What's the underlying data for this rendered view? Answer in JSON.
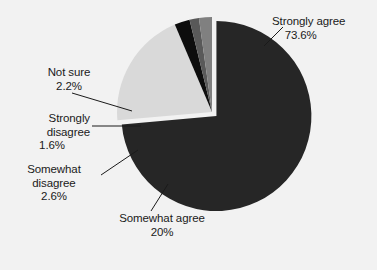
{
  "background_color": "#f2f2f2",
  "chart_data": {
    "type": "pie",
    "title": "",
    "subtitle": "",
    "xlabel": "",
    "ylabel": "",
    "legend_position": "none",
    "grid": false,
    "labels_outside": true,
    "exploded_slice": "Strongly agree",
    "categories": [
      "Strongly agree",
      "Somewhat agree",
      "Somewhat disagree",
      "Strongly disagree",
      "Not sure"
    ],
    "values": [
      73.6,
      20,
      2.6,
      1.6,
      2.2
    ],
    "value_labels": [
      "73.6%",
      "20%",
      "2.6%",
      "1.6%",
      "2.2%"
    ],
    "colors": [
      "#262626",
      "#d9d9d9",
      "#0d0d0d",
      "#595959",
      "#808080"
    ],
    "slices": [
      {
        "name": "Strongly agree",
        "value": 73.6,
        "value_label": "73.6%",
        "color": "#262626",
        "exploded": true
      },
      {
        "name": "Somewhat agree",
        "value": 20,
        "value_label": "20%",
        "color": "#d9d9d9",
        "exploded": false
      },
      {
        "name": "Somewhat disagree",
        "value": 2.6,
        "value_label": "2.6%",
        "color": "#0d0d0d",
        "exploded": false
      },
      {
        "name": "Strongly disagree",
        "value": 1.6,
        "value_label": "1.6%",
        "color": "#595959",
        "exploded": false
      },
      {
        "name": "Not sure",
        "value": 2.2,
        "value_label": "2.2%",
        "color": "#808080",
        "exploded": false
      }
    ]
  },
  "labels": {
    "strongly_agree": {
      "line1": "Strongly agree",
      "value": "73.6%"
    },
    "not_sure": {
      "line1": "Not sure",
      "value": "2.2%"
    },
    "strongly_disagree": {
      "line1": "Strongly",
      "line2": "disagree",
      "value": "1.6%"
    },
    "somewhat_disagree": {
      "line1": "Somewhat",
      "line2": "disagree",
      "value": "2.6%"
    },
    "somewhat_agree": {
      "line1": "Somewhat agree",
      "value": "20%"
    }
  }
}
